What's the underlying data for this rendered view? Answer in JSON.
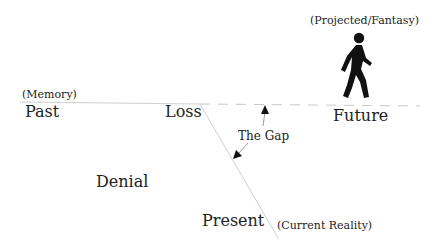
{
  "diagram": {
    "labels": {
      "past": "Past",
      "past_note": "(Memory)",
      "loss": "Loss",
      "future": "Future",
      "future_note": "(Projected/Fantasy)",
      "gap": "The Gap",
      "denial": "Denial",
      "present": "Present",
      "present_note": "(Current Reality)"
    },
    "icons": {
      "walker": "walking-person-icon"
    },
    "colors": {
      "line": "#cfcfcf",
      "text": "#222222",
      "figure": "#111111"
    }
  }
}
